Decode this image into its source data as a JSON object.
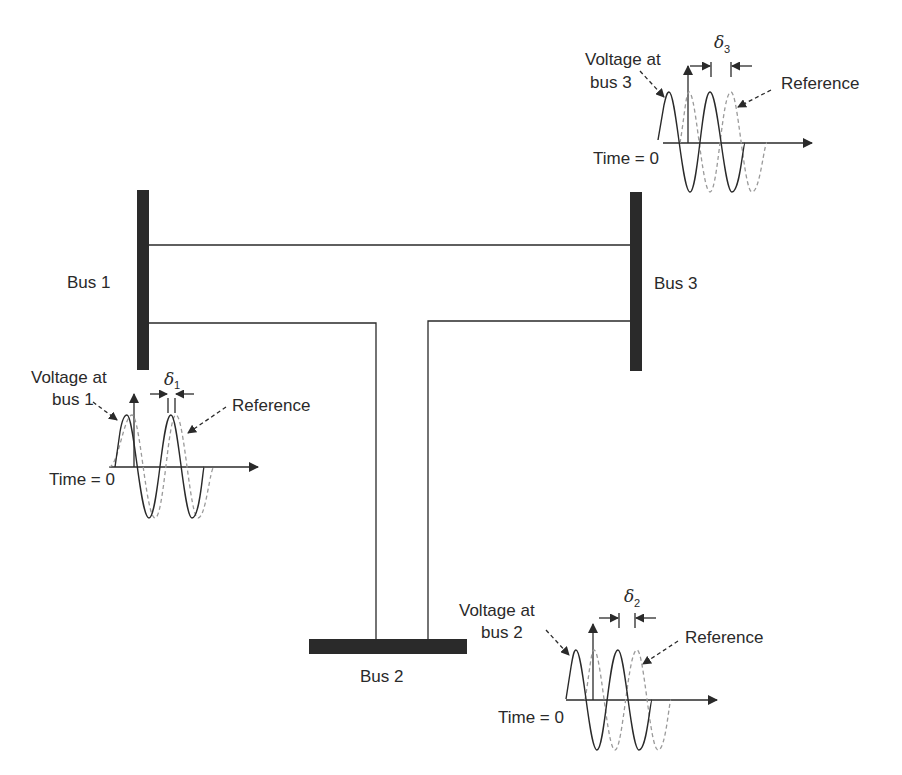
{
  "diagram": {
    "type": "three-bus power system one-line diagram with voltage phase angle waveforms",
    "colors": {
      "line": "#2a2a2a",
      "bus": "#2a2a2a",
      "reference": "#9a9a9a",
      "background": "#ffffff"
    },
    "buses": [
      {
        "id": "bus1",
        "label": "Bus 1",
        "orientation": "vertical"
      },
      {
        "id": "bus2",
        "label": "Bus 2",
        "orientation": "horizontal"
      },
      {
        "id": "bus3",
        "label": "Bus 3",
        "orientation": "vertical"
      }
    ],
    "lines": [
      {
        "from": "bus1",
        "to": "bus3"
      },
      {
        "from": "bus1",
        "to": "bus2"
      },
      {
        "from": "bus3",
        "to": "bus2"
      }
    ],
    "waveforms": [
      {
        "bus": "bus1",
        "voltage_label_line1": "Voltage at",
        "voltage_label_line2": "bus 1",
        "reference_label": "Reference",
        "time_label": "Time = 0",
        "delta_symbol": "δ",
        "delta_subscript": "1"
      },
      {
        "bus": "bus2",
        "voltage_label_line1": "Voltage at",
        "voltage_label_line2": "bus 2",
        "reference_label": "Reference",
        "time_label": "Time = 0",
        "delta_symbol": "δ",
        "delta_subscript": "2"
      },
      {
        "bus": "bus3",
        "voltage_label_line1": "Voltage at",
        "voltage_label_line2": "bus 3",
        "reference_label": "Reference",
        "time_label": "Time = 0",
        "delta_symbol": "δ",
        "delta_subscript": "3"
      }
    ]
  }
}
